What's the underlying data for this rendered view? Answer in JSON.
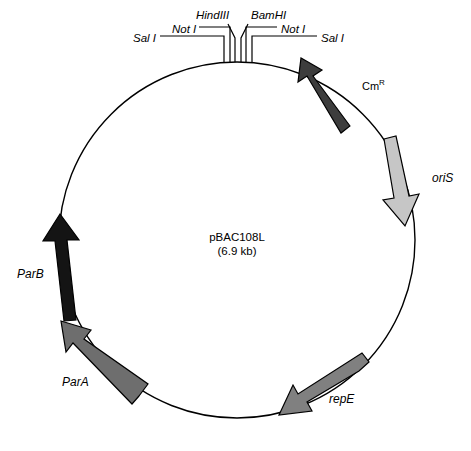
{
  "figure": {
    "plasmid_name": "pBAC108L",
    "plasmid_size": "(6.9 kb)",
    "circle": {
      "cx": 237,
      "cy": 240,
      "r": 178,
      "stroke": "#000000",
      "stroke_width": 1.4
    }
  },
  "restriction_sites": [
    {
      "id": "sal-i-left",
      "name": "Sal",
      "numeral": "I",
      "full": "Sal I",
      "side": "left",
      "x": 133,
      "y": 38
    },
    {
      "id": "not-i-left",
      "name": "Not",
      "numeral": "I",
      "full": "Not I",
      "side": "left",
      "x": 172,
      "y": 29
    },
    {
      "id": "hindiii",
      "name": "Hind",
      "numeral": "III",
      "full": "HindIII",
      "side": "top",
      "x": 196,
      "y": 13
    },
    {
      "id": "bamhi",
      "name": "Bam",
      "numeral": "HI",
      "full": "BamHI",
      "side": "top",
      "x": 251,
      "y": 13
    },
    {
      "id": "not-i-right",
      "name": "Not",
      "numeral": "I",
      "full": "Not I",
      "side": "right",
      "x": 281,
      "y": 29
    },
    {
      "id": "sal-i-right",
      "name": "Sal",
      "numeral": "I",
      "full": "Sal I",
      "side": "right",
      "x": 321,
      "y": 38
    }
  ],
  "genes": [
    {
      "id": "cm-r",
      "label": "Cm",
      "superscript": "R",
      "full": "CmR",
      "color": "#3d3d3d",
      "stroke": "#000000",
      "direction": "counterclockwise",
      "label_x": 362,
      "label_y": 83
    },
    {
      "id": "ori-s",
      "label": "oriS",
      "superscript": "",
      "full": "oriS",
      "color": "#c6c6c6",
      "stroke": "#000000",
      "direction": "clockwise",
      "label_x": 432,
      "label_y": 178
    },
    {
      "id": "rep-e",
      "label": "repE",
      "superscript": "",
      "full": "repE",
      "color": "#808080",
      "stroke": "#000000",
      "direction": "counterclockwise",
      "label_x": 329,
      "label_y": 399
    },
    {
      "id": "par-a",
      "label": "ParA",
      "superscript": "",
      "full": "ParA",
      "color": "#6e6e6e",
      "stroke": "#000000",
      "direction": "counterclockwise",
      "label_x": 62,
      "label_y": 382
    },
    {
      "id": "par-b",
      "label": "ParB",
      "superscript": "",
      "full": "ParB",
      "color": "#141414",
      "stroke": "#000000",
      "direction": "counterclockwise",
      "label_x": 17,
      "label_y": 274
    }
  ],
  "colors": {
    "background": "#ffffff",
    "line": "#000000",
    "dark_gene": "#3d3d3d",
    "light_gene": "#c6c6c6",
    "mid_gene": "#808080",
    "black_gene": "#141414"
  }
}
